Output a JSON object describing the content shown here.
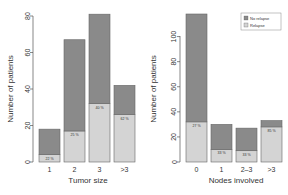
{
  "chart_data": [
    {
      "type": "bar",
      "stacked": true,
      "title": "",
      "xlabel": "Tumor size",
      "ylabel": "Number of patients",
      "categories": [
        "1",
        "2",
        "3",
        ">3"
      ],
      "series": [
        {
          "name": "No relapse",
          "values": [
            14,
            50,
            49,
            16
          ]
        },
        {
          "name": "Relapse",
          "values": [
            4,
            17,
            32,
            26
          ]
        }
      ],
      "totals": [
        18,
        67,
        81,
        42
      ],
      "annotations": [
        "22 %",
        "25 %",
        "40 %",
        "62 %"
      ],
      "ylim": [
        0,
        80
      ],
      "yticks": [
        "0",
        "20",
        "40",
        "60",
        "80"
      ],
      "grid": false
    },
    {
      "type": "bar",
      "stacked": true,
      "title": "",
      "xlabel": "Nodes involved",
      "ylabel": "Number of patients",
      "categories": [
        "0",
        "1",
        "2–3",
        ">3"
      ],
      "series": [
        {
          "name": "No relapse",
          "values": [
            86,
            20,
            18,
            5
          ]
        },
        {
          "name": "Relapse",
          "values": [
            32,
            10,
            9,
            28
          ]
        }
      ],
      "totals": [
        118,
        30,
        27,
        33
      ],
      "annotations": [
        "27 %",
        "33 %",
        "33 %",
        "85 %"
      ],
      "ylim": [
        0,
        118
      ],
      "yticks": [
        "0",
        "20",
        "40",
        "60",
        "80",
        "100"
      ],
      "grid": false,
      "legend": {
        "position": "top-right",
        "entries": [
          "No relapse",
          "Relapse"
        ]
      }
    }
  ],
  "colors": {
    "no_relapse": "#8a8a8a",
    "relapse": "#d4d4d4",
    "axis": "#555555"
  }
}
